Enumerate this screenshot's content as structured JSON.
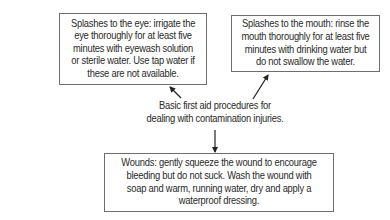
{
  "diagram": {
    "center": {
      "text": "Basic first aid procedures for dealing with contamination injuries.",
      "lines": [
        "Basic first aid procedures for",
        "dealing with contamination injuries."
      ]
    },
    "nodes": [
      {
        "id": "eye",
        "text": "Splashes to the eye: irrigate the eye thoroughly for at least five minutes with eyewash solution or sterile water. Use tap water if these are not available."
      },
      {
        "id": "mouth",
        "text": "Splashes to the mouth: rinse the mouth thoroughly for at least five minutes with drinking water but do not swallow the water."
      },
      {
        "id": "wounds",
        "text": "Wounds: gently squeeze the wound to encourage bleeding but do not suck. Wash the wound with soap and warm, running water, dry and apply a waterproof dressing."
      }
    ],
    "edges": [
      {
        "from": "center",
        "to": "eye"
      },
      {
        "from": "center",
        "to": "mouth"
      },
      {
        "from": "center",
        "to": "wounds"
      }
    ],
    "colors": {
      "border": "#6e6e6e",
      "text": "#2a2a2a",
      "arrow": "#222222",
      "background": "#ffffff"
    }
  }
}
